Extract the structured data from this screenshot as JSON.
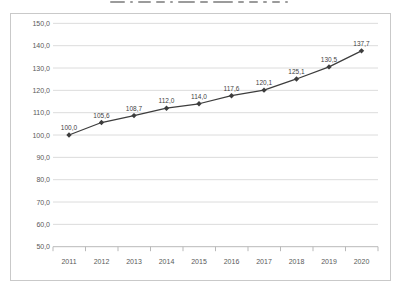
{
  "window": {
    "background": "#ffffff",
    "title_cropped_at_top": true
  },
  "chart_data": {
    "type": "line",
    "title": "",
    "xlabel": "",
    "ylabel": "",
    "categories": [
      "2011",
      "2012",
      "2013",
      "2014",
      "2015",
      "2016",
      "2017",
      "2018",
      "2019",
      "2020"
    ],
    "series": [
      {
        "name": "index",
        "values": [
          100.0,
          105.6,
          108.7,
          112.0,
          114.0,
          117.6,
          120.1,
          125.1,
          130.5,
          137.7
        ]
      }
    ],
    "point_labels": [
      "100,0",
      "105,6",
      "108,7",
      "112,0",
      "114,0",
      "117,6",
      "120,1",
      "125,1",
      "130,5",
      "137,7"
    ],
    "y_tick_labels": [
      "150,0",
      "140,0",
      "130,0",
      "120,0",
      "110,0",
      "100,0",
      "90,0",
      "80,0",
      "70,0",
      "60,0",
      "50,0"
    ],
    "ylim": [
      50,
      150
    ],
    "y_step": 10,
    "grid": true,
    "legend": "none",
    "marker": "diamond",
    "colors": {
      "line": "#3d3d3d",
      "marker": "#3d3d3d",
      "grid": "#dcdcdc",
      "axis": "#b9b9b9",
      "tick_text": "#595959",
      "point_label_text": "#3f3f3f",
      "frame_border": "#c9c9c9"
    }
  }
}
